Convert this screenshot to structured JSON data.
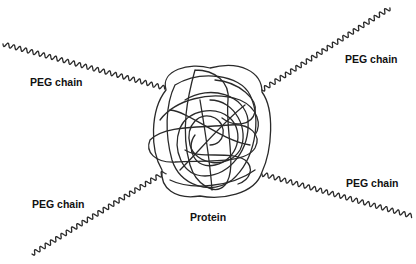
{
  "diagram": {
    "labels": {
      "peg_top_left": "PEG chain",
      "peg_top_right": "PEG chain",
      "peg_bottom_left": "PEG chain",
      "peg_bottom_right": "PEG chain",
      "protein": "Protein"
    },
    "colors": {
      "line": "#2a2a2a",
      "text": "#111111",
      "background": "#ffffff"
    }
  }
}
